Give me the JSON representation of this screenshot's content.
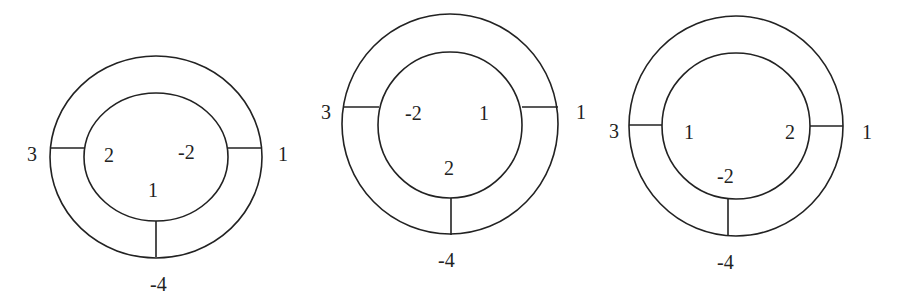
{
  "diagrams": [
    {
      "outer": {
        "cx": 156,
        "cy": 157,
        "rx": 106,
        "ry": 101
      },
      "inner": {
        "cx": 156,
        "cy": 157,
        "rx": 72,
        "ry": 64
      },
      "spokes": [
        {
          "x1": 50,
          "y1": 148,
          "x2": 85,
          "y2": 148
        },
        {
          "x1": 228,
          "y1": 148,
          "x2": 262,
          "y2": 148
        },
        {
          "x1": 156,
          "y1": 221,
          "x2": 156,
          "y2": 257
        }
      ],
      "outer_labels": {
        "left": "3",
        "right": "1",
        "bottom": "-4"
      },
      "inner_labels": {
        "left": "2",
        "right": "-2",
        "center": "1"
      }
    },
    {
      "outer": {
        "cx": 450,
        "cy": 124,
        "rx": 108,
        "ry": 110
      },
      "inner": {
        "cx": 450,
        "cy": 125,
        "rx": 72,
        "ry": 73
      },
      "spokes": [
        {
          "x1": 343,
          "y1": 107,
          "x2": 379,
          "y2": 107
        },
        {
          "x1": 522,
          "y1": 107,
          "x2": 558,
          "y2": 107
        },
        {
          "x1": 451,
          "y1": 198,
          "x2": 451,
          "y2": 235
        }
      ],
      "outer_labels": {
        "left": "3",
        "right": "1",
        "bottom": "-4"
      },
      "inner_labels": {
        "left": "-2",
        "right": "1",
        "center": "2"
      }
    },
    {
      "outer": {
        "cx": 736,
        "cy": 126,
        "rx": 107,
        "ry": 110
      },
      "inner": {
        "cx": 736,
        "cy": 126,
        "rx": 74,
        "ry": 73
      },
      "spokes": [
        {
          "x1": 629,
          "y1": 125,
          "x2": 662,
          "y2": 125
        },
        {
          "x1": 810,
          "y1": 126,
          "x2": 843,
          "y2": 126
        },
        {
          "x1": 728,
          "y1": 199,
          "x2": 728,
          "y2": 236
        }
      ],
      "outer_labels": {
        "left": "3",
        "right": "1",
        "bottom": "-4"
      },
      "inner_labels": {
        "left": "1",
        "right": "2",
        "center": "-2"
      }
    }
  ]
}
